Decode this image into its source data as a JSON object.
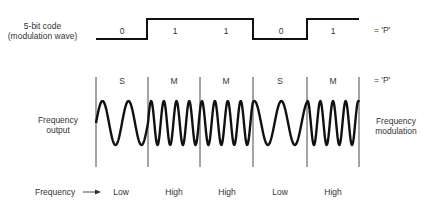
{
  "code_label_line1": "5-bit code",
  "code_label_line2": "(modulation wave)",
  "bits": [
    "0",
    "1",
    "1",
    "0",
    "1"
  ],
  "code_equals": "= 'P'",
  "segments": [
    "S",
    "M",
    "M",
    "S",
    "M"
  ],
  "segments_equals": "= 'P'",
  "left_label_line1": "Frequency",
  "left_label_line2": "output",
  "right_label_line1": "Frequency",
  "right_label_line2": "modulation",
  "frequency_label": "Frequency",
  "frequencies": [
    "Low",
    "High",
    "High",
    "Low",
    "High"
  ],
  "colors": {
    "line": "#111111",
    "text": "#333333"
  }
}
